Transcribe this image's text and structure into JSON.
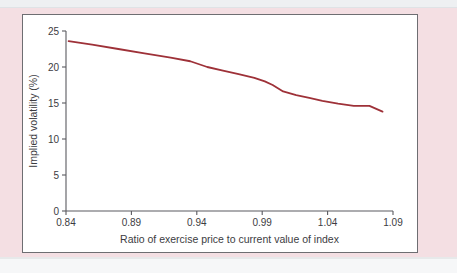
{
  "figure": {
    "panel_background": "#ffffff",
    "panel_border_color": "#6e6e72",
    "page_background": "#f4dfe3",
    "band_color": "#eef0f2"
  },
  "chart_data": {
    "type": "line",
    "title": "",
    "xlabel": "Ratio of exercise price to current value of index",
    "ylabel": "Implied volatility (%)",
    "xlim": [
      0.84,
      1.09
    ],
    "ylim": [
      0,
      25
    ],
    "xticks": [
      0.84,
      0.89,
      0.94,
      0.99,
      1.04,
      1.09
    ],
    "xtick_labels": [
      "0.84",
      "0.89",
      "0.94",
      "0.99",
      "1.04",
      "1.09"
    ],
    "yticks": [
      0,
      5,
      10,
      15,
      20,
      25
    ],
    "ytick_labels": [
      "0",
      "5",
      "10",
      "15",
      "20",
      "25"
    ],
    "grid": false,
    "legend": false,
    "series": [
      {
        "name": "Implied volatility",
        "color": "#9e3138",
        "line_width": 1.8,
        "x": [
          0.842,
          0.86,
          0.88,
          0.9,
          0.92,
          0.935,
          0.948,
          0.96,
          0.972,
          0.984,
          0.992,
          0.998,
          1.006,
          1.016,
          1.026,
          1.036,
          1.048,
          1.06,
          1.072,
          1.082
        ],
        "y": [
          23.6,
          23.1,
          22.5,
          21.9,
          21.3,
          20.8,
          20.0,
          19.5,
          19.0,
          18.5,
          18.0,
          17.5,
          16.6,
          16.1,
          15.7,
          15.3,
          14.9,
          14.6,
          14.6,
          13.8
        ]
      }
    ]
  }
}
